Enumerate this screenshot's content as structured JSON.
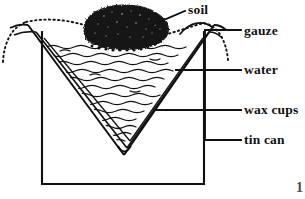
{
  "figure": {
    "page_number": "1",
    "ink_color": "#111111",
    "background_color": "#ffffff",
    "soil_fill_color": "#1a1a1a"
  },
  "labels": [
    {
      "id": "soil",
      "text": "soil",
      "leader": "diagonal"
    },
    {
      "id": "gauze",
      "text": "gauze",
      "leader": "horizontal"
    },
    {
      "id": "water",
      "text": "water",
      "leader": "horizontal"
    },
    {
      "id": "wax_cups",
      "text": "wax cups",
      "leader": "horizontal"
    },
    {
      "id": "tin_can",
      "text": "tin can",
      "leader": "horizontal"
    }
  ],
  "parts": {
    "soil": "dark irregular clump resting on gauze",
    "gauze": "dotted arc draped across the can opening",
    "water": "wavy horizontal lines filling the cone",
    "wax_cups": "nested V-shaped double-walled cups",
    "tin_can": "open-topped rectangular container"
  }
}
